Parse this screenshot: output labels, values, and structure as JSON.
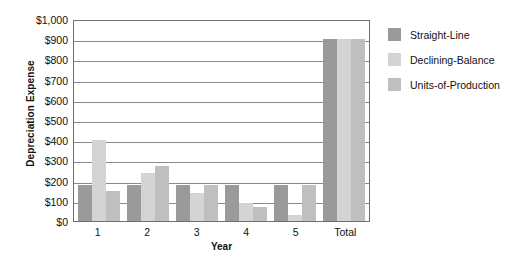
{
  "chart_data": {
    "type": "bar",
    "title": "",
    "xlabel": "Year",
    "ylabel": "Depreciation Expense",
    "categories": [
      "1",
      "2",
      "3",
      "4",
      "5",
      "Total"
    ],
    "ylim": [
      0,
      1000
    ],
    "yticks": [
      0,
      100,
      200,
      300,
      400,
      500,
      600,
      700,
      800,
      900,
      1000
    ],
    "ytick_labels": [
      "$0",
      "$100",
      "$200",
      "$300",
      "$400",
      "$500",
      "$600",
      "$700",
      "$800",
      "$900",
      "$1,000"
    ],
    "grid": true,
    "legend_position": "right",
    "series": [
      {
        "name": "Straight-Line",
        "color": "#9a9a9a",
        "values": [
          180,
          180,
          180,
          180,
          180,
          900
        ]
      },
      {
        "name": "Declining-Balance",
        "color": "#d4d4d4",
        "values": [
          400,
          240,
          140,
          90,
          30,
          900
        ]
      },
      {
        "name": "Units-of-Production",
        "color": "#bfbfbf",
        "values": [
          150,
          270,
          180,
          70,
          180,
          900
        ]
      }
    ]
  },
  "legend": {
    "items": [
      {
        "label": "Straight-Line",
        "color": "#9a9a9a"
      },
      {
        "label": "Declining-Balance",
        "color": "#d4d4d4"
      },
      {
        "label": "Units-of-Production",
        "color": "#bfbfbf"
      }
    ]
  },
  "axes": {
    "y_title": "Depreciation Expense",
    "x_title": "Year"
  }
}
